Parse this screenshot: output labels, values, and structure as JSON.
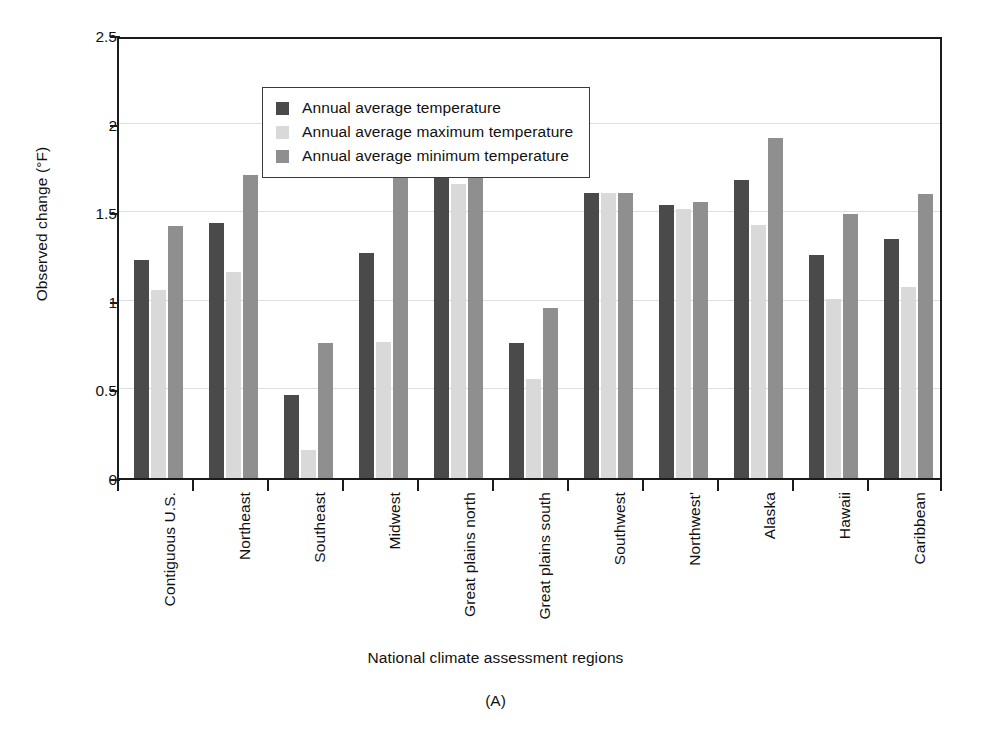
{
  "chart_data": {
    "type": "bar",
    "title": "",
    "panel_label": "(A)",
    "xlabel": "National climate assessment regions",
    "ylabel": "Observed change (°F)",
    "ylim": [
      0,
      2.5
    ],
    "yticks": [
      "0",
      "0.5",
      "1",
      "1.5",
      "2",
      "2.5"
    ],
    "ytick_values": [
      0,
      0.5,
      1,
      1.5,
      2,
      2.5
    ],
    "grid": true,
    "grid_axis": "y",
    "legend_position": "upper-left-inside",
    "categories": [
      "Contiguous U.S.",
      "Northeast",
      "Southeast",
      "Midwest",
      "Great plains north",
      "Great plains south",
      "Southwest",
      "Northwest'",
      "Alaska",
      "Hawaii",
      "Caribbean"
    ],
    "series": [
      {
        "name": "Annual average temperature",
        "color": "#4a4a4a",
        "values": [
          1.23,
          1.44,
          0.47,
          1.27,
          1.7,
          0.76,
          1.61,
          1.54,
          1.68,
          1.26,
          1.35
        ]
      },
      {
        "name": "Annual average maximum temperature",
        "color": "#d9d9d9",
        "values": [
          1.06,
          1.16,
          0.16,
          0.77,
          1.66,
          0.56,
          1.61,
          1.52,
          1.43,
          1.01,
          1.08
        ]
      },
      {
        "name": "Annual average minimum temperature",
        "color": "#8f8f8f",
        "values": [
          1.42,
          1.71,
          0.76,
          1.76,
          1.72,
          0.96,
          1.61,
          1.56,
          1.92,
          1.49,
          1.6
        ]
      }
    ]
  },
  "figure": {
    "y_axis_title": "Observed change (°F)",
    "x_axis_title": "National climate assessment regions",
    "caption": "(A)"
  },
  "legend": {
    "items": [
      {
        "label": "Annual average temperature",
        "color": "#4a4a4a"
      },
      {
        "label": "Annual average maximum temperature",
        "color": "#d9d9d9"
      },
      {
        "label": "Annual average minimum temperature",
        "color": "#8f8f8f"
      }
    ]
  }
}
